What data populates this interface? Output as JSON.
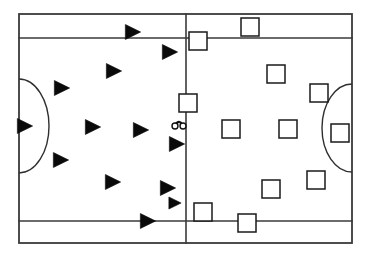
{
  "diagram": {
    "field_type": "soccer-pitch",
    "background_color": "#ffffff",
    "line_color": "#3a3a3a",
    "team_a_color": "#0a0a0a",
    "team_b_color": "#ffffff",
    "team_a_label": "Team A (filled triangles)",
    "team_b_label": "Team B (open squares)"
  },
  "chart_data": {
    "type": "scatter",
    "xlabel": "",
    "ylabel": "",
    "xlim": [
      19,
      352
    ],
    "ylim": [
      14,
      243
    ],
    "grid": false,
    "legend": "none",
    "field": {
      "border": {
        "x": 19,
        "y": 14,
        "width": 333,
        "height": 229
      },
      "lines": [
        {
          "name": "top-area-line",
          "x1": 19,
          "y1": 38,
          "x2": 352,
          "y2": 38
        },
        {
          "name": "bottom-area-line",
          "x1": 19,
          "y1": 221,
          "x2": 352,
          "y2": 221
        },
        {
          "name": "halfway-line",
          "x1": 186,
          "y1": 14,
          "x2": 186,
          "y2": 243
        }
      ],
      "arcs": [
        {
          "name": "left-penalty-arc",
          "cx": 19,
          "cy": 126,
          "rx": 30,
          "ry": 47,
          "side": "left"
        },
        {
          "name": "right-penalty-arc",
          "cx": 352,
          "cy": 128,
          "rx": 30,
          "ry": 44,
          "side": "right"
        }
      ]
    },
    "series": [
      {
        "name": "Team A (filled triangles)",
        "marker": "triangle-right",
        "color": "#0a0a0a",
        "points": [
          {
            "x": 133,
            "y": 32,
            "size": 15
          },
          {
            "x": 170,
            "y": 52,
            "size": 15
          },
          {
            "x": 114,
            "y": 71,
            "size": 15
          },
          {
            "x": 62,
            "y": 88,
            "size": 15
          },
          {
            "x": 25,
            "y": 126,
            "size": 15
          },
          {
            "x": 93,
            "y": 127,
            "size": 15
          },
          {
            "x": 141,
            "y": 130,
            "size": 15
          },
          {
            "x": 177,
            "y": 144,
            "size": 15
          },
          {
            "x": 61,
            "y": 160,
            "size": 15
          },
          {
            "x": 113,
            "y": 182,
            "size": 15
          },
          {
            "x": 168,
            "y": 188,
            "size": 15
          },
          {
            "x": 148,
            "y": 221,
            "size": 15
          },
          {
            "x": 175,
            "y": 203,
            "size": 12
          }
        ]
      },
      {
        "name": "Team B (open squares)",
        "marker": "square",
        "color": "#ffffff",
        "points": [
          {
            "x": 250,
            "y": 27,
            "size": 18
          },
          {
            "x": 198,
            "y": 41,
            "size": 18
          },
          {
            "x": 276,
            "y": 74,
            "size": 18
          },
          {
            "x": 319,
            "y": 93,
            "size": 18
          },
          {
            "x": 188,
            "y": 103,
            "size": 18
          },
          {
            "x": 231,
            "y": 129,
            "size": 18
          },
          {
            "x": 288,
            "y": 129,
            "size": 18
          },
          {
            "x": 340,
            "y": 133,
            "size": 18
          },
          {
            "x": 316,
            "y": 180,
            "size": 18
          },
          {
            "x": 271,
            "y": 189,
            "size": 18
          },
          {
            "x": 203,
            "y": 212,
            "size": 18
          },
          {
            "x": 247,
            "y": 223,
            "size": 18
          }
        ]
      },
      {
        "name": "Ball marker",
        "marker": "ball",
        "color": "#111111",
        "points": [
          {
            "x": 179,
            "y": 126,
            "size": 6
          }
        ]
      }
    ]
  }
}
